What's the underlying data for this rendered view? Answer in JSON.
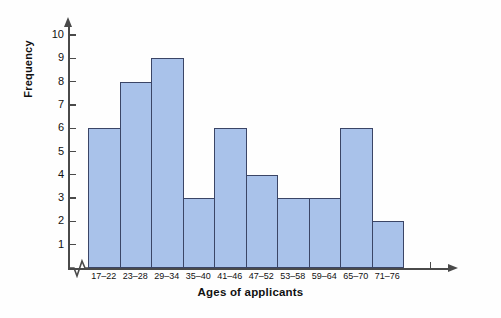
{
  "chart_data": {
    "type": "bar",
    "title": "",
    "subtitle": "",
    "xlabel": "Ages of applicants",
    "ylabel": "Frequency",
    "categories": [
      "17–22",
      "23–28",
      "29–34",
      "35–40",
      "41–46",
      "47–52",
      "53–58",
      "59–64",
      "65–70",
      "71–76"
    ],
    "values": [
      6,
      8,
      9,
      3,
      6,
      4,
      3,
      3,
      6,
      2
    ],
    "ylim": [
      0,
      10
    ],
    "yticks": [
      1,
      2,
      3,
      4,
      5,
      6,
      7,
      8,
      9,
      10
    ],
    "ytick_labels": [
      "1",
      "2",
      "3",
      "4",
      "5",
      "6",
      "7",
      "8",
      "9",
      "10"
    ],
    "grid": false,
    "legend": null,
    "bar_fill_color": "#a9c2ea",
    "bar_border_color": "#3b4566",
    "axis_color": "#4a4a4a",
    "axis_break": "x-axis zigzag break between origin and first bar"
  }
}
